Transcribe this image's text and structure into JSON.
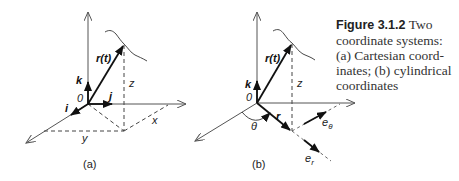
{
  "figure": {
    "number": "Figure 3.1.2",
    "caption_lines": [
      "Two",
      "coordinate systems:",
      "(a) Cartesian coord-",
      "inates; (b) cylindrical",
      "coordinates"
    ]
  },
  "panel_a": {
    "sublabel": "(a)",
    "labels": {
      "position_vector": "r(t)",
      "unit_k": "k",
      "unit_i": "i",
      "unit_j": "j",
      "origin": "0",
      "z": "z",
      "x": "x",
      "y": "y"
    }
  },
  "panel_b": {
    "sublabel": "(b)",
    "labels": {
      "position_vector": "r(t)",
      "unit_k": "k",
      "origin": "0",
      "radial_vector": "r",
      "angle": "θ",
      "z": "z",
      "e_theta_base": "e",
      "e_theta_sub": "θ",
      "e_r_base": "e",
      "e_r_sub": "r"
    }
  },
  "colors": {
    "axis": "#555555",
    "vector": "#111111",
    "text": "#222222",
    "background": "#ffffff"
  }
}
